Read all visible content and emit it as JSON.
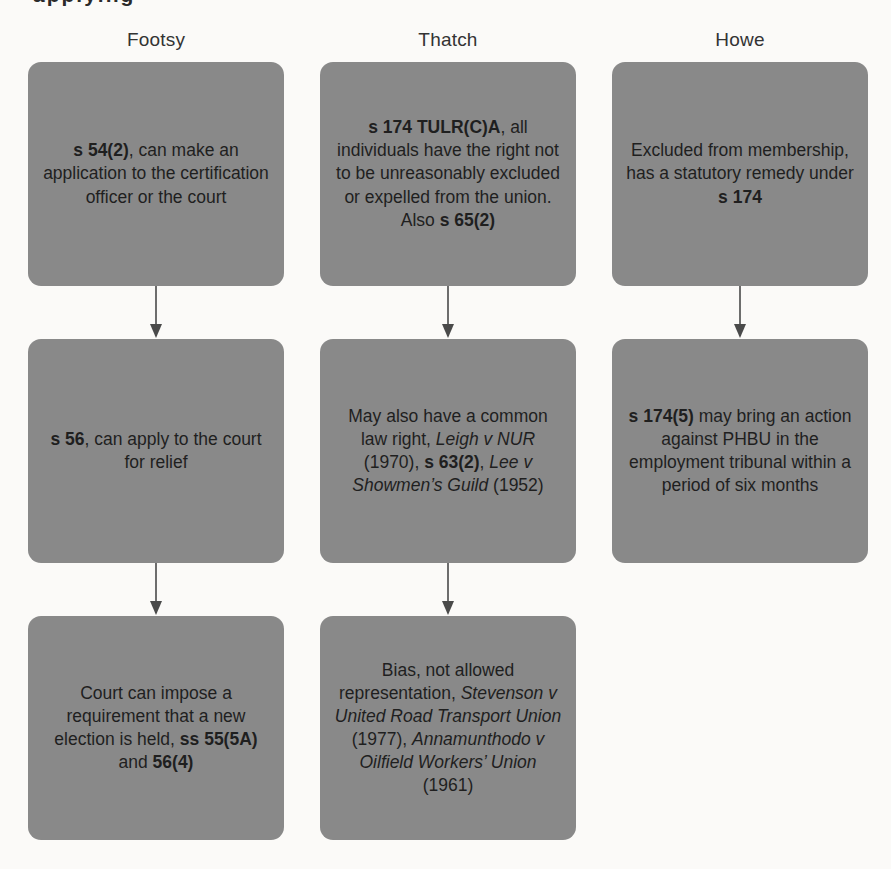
{
  "page": {
    "top_fragment": "applying",
    "background": "#fbfaf8",
    "box_fill": "#898989",
    "box_text_color": "#1f1f1f",
    "header_text_color": "#333333",
    "arrow_color": "#4a4a4a"
  },
  "columns": [
    {
      "header": "Footsy",
      "boxes": [
        {
          "segments": [
            {
              "t": "s 54(2)",
              "b": true
            },
            {
              "t": ", can make an application to the certification officer or the court"
            }
          ]
        },
        {
          "segments": [
            {
              "t": "s 56",
              "b": true
            },
            {
              "t": ", can apply to the court for relief"
            }
          ]
        },
        {
          "segments": [
            {
              "t": "Court can impose a requirement that a new election is held, "
            },
            {
              "t": "ss 55(5A)",
              "b": true
            },
            {
              "t": " and "
            },
            {
              "t": "56(4)",
              "b": true
            }
          ]
        }
      ]
    },
    {
      "header": "Thatch",
      "boxes": [
        {
          "segments": [
            {
              "t": "s 174 TULR(C)A",
              "b": true
            },
            {
              "t": ", all individuals have the right not to be unreasonably excluded or expelled from the union.  Also "
            },
            {
              "t": "s 65(2)",
              "b": true
            }
          ]
        },
        {
          "segments": [
            {
              "t": "May also have a common law right, "
            },
            {
              "t": "Leigh v NUR",
              "i": true
            },
            {
              "t": " (1970), "
            },
            {
              "t": "s 63(2)",
              "b": true
            },
            {
              "t": ", "
            },
            {
              "t": "Lee v Showmen’s Guild",
              "i": true
            },
            {
              "t": " (1952)"
            }
          ]
        },
        {
          "segments": [
            {
              "t": "Bias, not allowed representation, "
            },
            {
              "t": "Stevenson v United Road Transport Union",
              "i": true
            },
            {
              "t": " (1977), "
            },
            {
              "t": "Annamunthodo v Oilfield Workers’ Union",
              "i": true
            },
            {
              "t": " (1961)"
            }
          ]
        }
      ]
    },
    {
      "header": "Howe",
      "boxes": [
        {
          "segments": [
            {
              "t": "Excluded from membership, has a statutory remedy under "
            },
            {
              "t": "s 174",
              "b": true
            }
          ]
        },
        {
          "segments": [
            {
              "t": "s 174(5)",
              "b": true
            },
            {
              "t": " may bring an action against PHBU in the employment tribunal within a period of six months"
            }
          ]
        }
      ]
    }
  ]
}
